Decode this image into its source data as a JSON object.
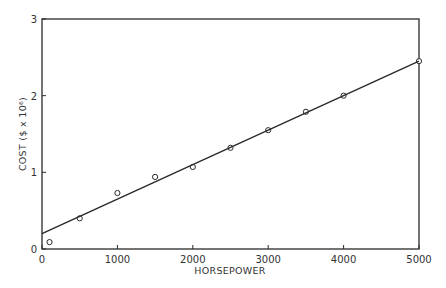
{
  "chart_data": {
    "type": "scatter",
    "title": "",
    "xlabel": "HORSEPOWER",
    "ylabel": "COST ($ x 10⁶)",
    "xlim": [
      0,
      5000
    ],
    "ylim": [
      0,
      3
    ],
    "x_ticks": [
      0,
      1000,
      2000,
      3000,
      4000,
      5000
    ],
    "x_tick_labels": [
      "0",
      "1000",
      "2000",
      "3000",
      "4000",
      "5000"
    ],
    "y_ticks": [
      0,
      1,
      2,
      3
    ],
    "y_tick_labels": [
      "0",
      "1",
      "2",
      "3"
    ],
    "grid": false,
    "legend": null,
    "series": [
      {
        "name": "observed",
        "marker": "open-circle",
        "x": [
          100,
          500,
          1000,
          1500,
          2000,
          2500,
          3000,
          3500,
          4000,
          5000
        ],
        "y": [
          0.09,
          0.4,
          0.73,
          0.94,
          1.07,
          1.32,
          1.55,
          1.79,
          2.0,
          2.45
        ]
      },
      {
        "name": "fit-line",
        "style": "solid-line",
        "x": [
          0,
          5000
        ],
        "y": [
          0.2,
          2.45
        ]
      }
    ]
  },
  "layout": {
    "plot_left": 42,
    "plot_right": 419,
    "plot_top": 19,
    "plot_bottom": 249,
    "line_color": "#2a2a2a"
  }
}
